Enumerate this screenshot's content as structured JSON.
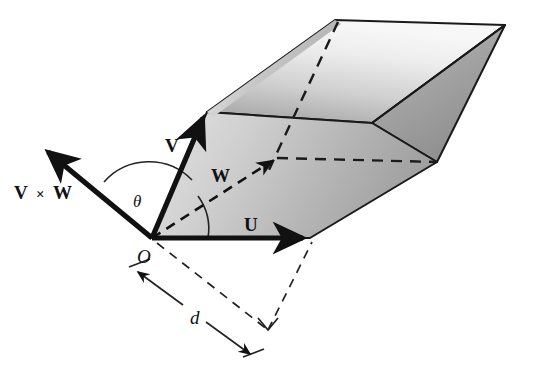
{
  "figure": {
    "background_color": "#ffffff",
    "ink_color": "#111111",
    "width": 541,
    "height": 382
  },
  "labels": {
    "cross_product": "V",
    "cross_symbol": "×",
    "cross_product_second": "W",
    "vector_v": "V",
    "vector_w": "W",
    "vector_u": "U",
    "origin": "O",
    "angle_theta": "θ",
    "distance_d": "d"
  },
  "geometry": {
    "origin_point": [
      152,
      238
    ],
    "vector_u_tip": [
      310,
      238
    ],
    "vector_v_tip": [
      207,
      112
    ],
    "vector_w_tip": [
      277,
      158
    ],
    "cross_product_tip": [
      42,
      148
    ],
    "top_apex": [
      335,
      20
    ],
    "right_apex": [
      505,
      25
    ],
    "bottom_right_vertex": [
      437,
      162
    ],
    "dashed_foot": [
      268,
      330
    ]
  },
  "shading": {
    "top_face_light": "#f2f2f2",
    "top_face_dark": "#a8a8a8",
    "front_face_light": "#d9d9d9",
    "front_face_dark": "#9a9a9a",
    "right_face_light": "#b4b4b4",
    "right_face_dark": "#8a8a8a",
    "left_panel_light": "#cfcfcf",
    "left_panel_dark": "#9d9d9d"
  },
  "annotations": {
    "theta_description": "angle between V × W and V",
    "d_description": "distance measured along dimension line from O"
  }
}
